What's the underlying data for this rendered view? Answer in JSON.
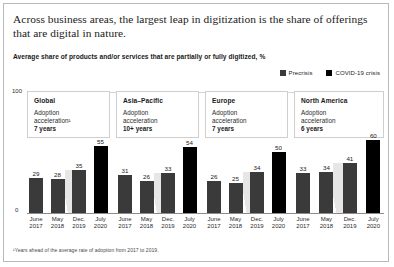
{
  "title": "Across business areas, the largest leap in digitization is the share of offerings that are digital in nature.",
  "subtitle": "Average share of products and/or services that are partially or fully digitized, %",
  "legend": [
    {
      "label": "Precrisis",
      "color": "#3a3a3a",
      "icon": "square-swatch-icon"
    },
    {
      "label": "COVID-19 crisis",
      "color": "#000000",
      "icon": "square-swatch-icon"
    }
  ],
  "axis": {
    "top": "100",
    "zero": "0"
  },
  "footnote": "¹Years ahead of the average rate of adoption from 2017 to 2019.",
  "chart_data": {
    "type": "bar",
    "title": "Average share of products and/or services that are partially or fully digitized, %",
    "xlabel": "",
    "ylabel": "%",
    "ylim": [
      0,
      100
    ],
    "grid": true,
    "legend_position": "top-right",
    "categories": [
      "June 2017",
      "May 2018",
      "Dec. 2019",
      "July 2020"
    ],
    "series": [
      {
        "name": "Precrisis",
        "color": "#3a3a3a",
        "applies_to": [
          "June 2017",
          "May 2018",
          "Dec. 2019"
        ]
      },
      {
        "name": "COVID-19 crisis",
        "color": "#000000",
        "applies_to": [
          "July 2020"
        ]
      }
    ],
    "panels": [
      {
        "name": "Global",
        "acceleration_label": "Adoption\nacceleration¹\n",
        "acceleration_value": "7 years",
        "values": [
          29,
          28,
          35,
          55
        ]
      },
      {
        "name": "Asia–Pacific",
        "acceleration_label": "Adoption\nacceleration\n",
        "acceleration_value": "10+ years",
        "values": [
          31,
          26,
          33,
          54
        ]
      },
      {
        "name": "Europe",
        "acceleration_label": "Adoption\nacceleration\n",
        "acceleration_value": "7 years",
        "values": [
          26,
          25,
          34,
          50
        ]
      },
      {
        "name": "North America",
        "acceleration_label": "Adoption\nacceleration\n",
        "acceleration_value": "6 years",
        "values": [
          33,
          34,
          41,
          60
        ]
      }
    ]
  }
}
